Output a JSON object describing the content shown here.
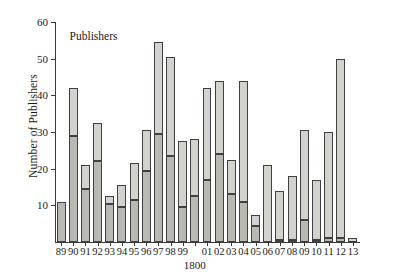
{
  "chart_data": {
    "type": "bar",
    "title": "",
    "annotation": "Publishers",
    "xlabel": "1800",
    "ylabel": "Number of Publishers",
    "categories": [
      "89",
      "90",
      "91",
      "92",
      "93",
      "94",
      "95",
      "96",
      "97",
      "98",
      "99",
      "00",
      "01",
      "02",
      "03",
      "04",
      "05",
      "06",
      "07",
      "08",
      "09",
      "10",
      "11",
      "12",
      "13"
    ],
    "origin_label": "1800",
    "origin_category": "00",
    "ylim": [
      0,
      60
    ],
    "yticks": [
      10,
      20,
      30,
      40,
      50,
      60
    ],
    "grid": false,
    "legend": "none",
    "stacked": true,
    "series": [
      {
        "name": "lower",
        "color": "#b9b9b4",
        "values": [
          11,
          29,
          14.5,
          22,
          10.5,
          9.5,
          11.5,
          19.5,
          29.5,
          23.5,
          9.5,
          12.5,
          17,
          24,
          13,
          11,
          4.5,
          0,
          0.5,
          0.5,
          6,
          0.5,
          1,
          1,
          0
        ]
      },
      {
        "name": "upper",
        "color": "#d2d2cf",
        "values": [
          0,
          13,
          6.5,
          10.5,
          2,
          6,
          10,
          11,
          25,
          27,
          18,
          15.5,
          25,
          20,
          9.5,
          33,
          3,
          21,
          13.5,
          17.5,
          24.5,
          16.5,
          29,
          49,
          1
        ]
      }
    ],
    "totals": [
      11,
      42,
      21,
      32.5,
      12.5,
      15.5,
      21.5,
      30.5,
      54.5,
      50.5,
      27.5,
      28,
      42,
      44,
      22.5,
      44,
      7.5,
      21,
      14,
      18,
      30.5,
      17,
      30,
      50,
      1
    ]
  }
}
